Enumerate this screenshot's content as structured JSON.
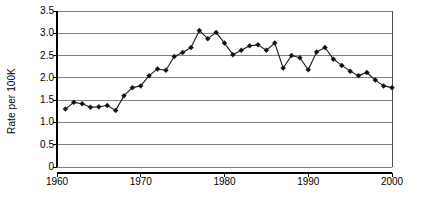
{
  "chart_data": {
    "type": "line",
    "title": "",
    "subtitle": "",
    "xlabel": "",
    "ylabel": "Rate per 100K",
    "xlim": [
      1960,
      2000
    ],
    "ylim": [
      0,
      3.5
    ],
    "xticks": [
      1960,
      1970,
      1980,
      1990,
      2000
    ],
    "xtick_labels": [
      "1960",
      "1970",
      "1980",
      "1990",
      "2000"
    ],
    "yticks": [
      0,
      0.5,
      1.0,
      1.5,
      2.0,
      2.5,
      3.0,
      3.5
    ],
    "ytick_labels": [
      "0",
      "0.5",
      "1.0",
      "1.5",
      "2.0",
      "2.5",
      "3.0",
      "3.5"
    ],
    "grid": "horizontal",
    "legend": "none",
    "marker": "diamond",
    "line_color": "#1a1a1a",
    "marker_color": "#111111",
    "grid_color": "#808080",
    "series": [
      {
        "name": "Rate per 100K",
        "x": [
          1961,
          1962,
          1963,
          1964,
          1965,
          1966,
          1967,
          1968,
          1969,
          1970,
          1971,
          1972,
          1973,
          1974,
          1975,
          1976,
          1977,
          1978,
          1979,
          1980,
          1981,
          1982,
          1983,
          1984,
          1985,
          1986,
          1987,
          1988,
          1989,
          1990,
          1991,
          1992,
          1993,
          1994,
          1995,
          1996,
          1997,
          1998,
          1999,
          2000
        ],
        "values": [
          1.3,
          1.45,
          1.42,
          1.34,
          1.35,
          1.38,
          1.27,
          1.6,
          1.78,
          1.82,
          2.05,
          2.2,
          2.17,
          2.48,
          2.57,
          2.68,
          3.06,
          2.88,
          3.02,
          2.78,
          2.52,
          2.62,
          2.72,
          2.74,
          2.62,
          2.78,
          2.22,
          2.5,
          2.45,
          2.18,
          2.58,
          2.68,
          2.42,
          2.28,
          2.15,
          2.05,
          2.12,
          1.95,
          1.82,
          1.78
        ]
      }
    ]
  },
  "axis": {
    "y_title": "Rate per 100K"
  }
}
